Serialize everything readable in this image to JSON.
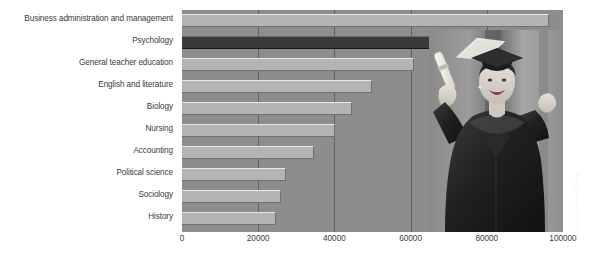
{
  "chart_data": {
    "type": "bar",
    "orientation": "horizontal",
    "title": "",
    "subtitle": "",
    "xlabel": "",
    "ylabel": "",
    "categories": [
      "Business administration and management",
      "Psychology",
      "General teacher education",
      "English and literature",
      "Biology",
      "Nursing",
      "Accounting",
      "Political science",
      "Sociology",
      "History"
    ],
    "values": [
      96300,
      74100,
      61000,
      49900,
      44600,
      40100,
      34600,
      27400,
      25900,
      24800
    ],
    "xlim": [
      0,
      100000
    ],
    "xticks": [
      0,
      20000,
      40000,
      60000,
      80000,
      100000
    ],
    "xticklabels": [
      "0",
      "20000",
      "40000",
      "60000",
      "80000",
      "100000"
    ],
    "grid": true,
    "grid_axis": "x",
    "legend": false,
    "highlight_index": 1,
    "colors": {
      "bar": "#b4b4b4",
      "bar_highlight": "#3a3a3a",
      "plot_background": "#8d8d8d",
      "figure_background": "#ffffff",
      "gridline": "#3c3c3c",
      "text": "#3b3b3b"
    }
  },
  "credit": {
    "text": "© Jim Cummins/Corbis"
  },
  "photo": {
    "alt_name": "graduate-celebrating-photo",
    "description": "Smiling graduate in cap and gown raising a diploma"
  }
}
